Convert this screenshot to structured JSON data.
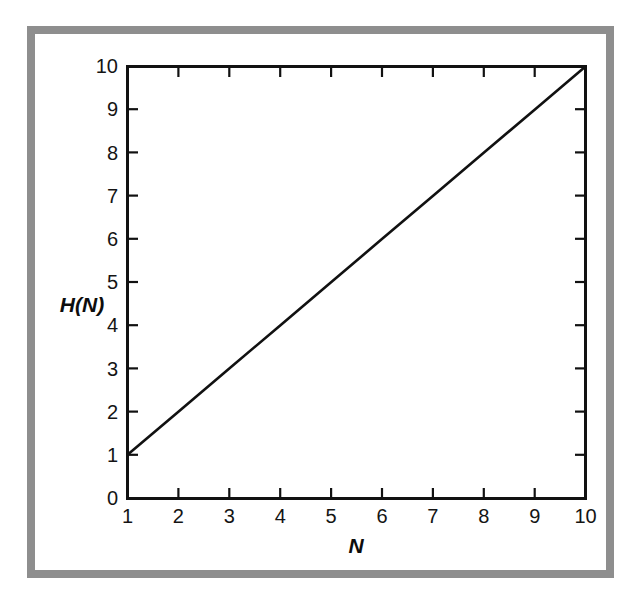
{
  "figure": {
    "background_color": "#ffffff",
    "frame_color": "#8e8e8e",
    "line_color": "#111111",
    "axis_color": "#111111"
  },
  "chart_data": {
    "type": "line",
    "title": "",
    "subtitle": "",
    "xlabel": "N",
    "ylabel": "H(N)",
    "xlim": [
      1,
      10
    ],
    "ylim": [
      0,
      10
    ],
    "grid": false,
    "legend": false,
    "legend_position": "none",
    "x_ticks": [
      "1",
      "2",
      "3",
      "4",
      "5",
      "6",
      "7",
      "8",
      "9",
      "10"
    ],
    "y_ticks": [
      "0",
      "1",
      "2",
      "3",
      "4",
      "5",
      "6",
      "7",
      "8",
      "9",
      "10"
    ],
    "x": [
      1,
      2,
      3,
      4,
      5,
      6,
      7,
      8,
      9,
      10
    ],
    "series": [
      {
        "name": "H(N)",
        "values": [
          1,
          2,
          3,
          4,
          5,
          6,
          7,
          8,
          9,
          10
        ]
      }
    ],
    "annotations": []
  },
  "axis_titles": {
    "y": "H(N)",
    "x": "N"
  },
  "y_tick_labels": {
    "t0": "0",
    "t1": "1",
    "t2": "2",
    "t3": "3",
    "t4": "4",
    "t5": "5",
    "t6": "6",
    "t7": "7",
    "t8": "8",
    "t9": "9",
    "t10": "10"
  },
  "x_tick_labels": {
    "t1": "1",
    "t2": "2",
    "t3": "3",
    "t4": "4",
    "t5": "5",
    "t6": "6",
    "t7": "7",
    "t8": "8",
    "t9": "9",
    "t10": "10"
  }
}
